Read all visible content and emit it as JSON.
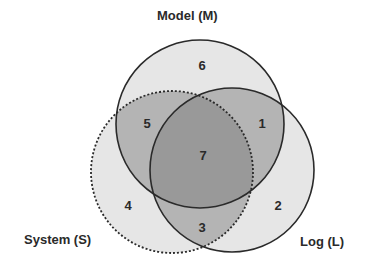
{
  "diagram": {
    "type": "venn",
    "sets": [
      {
        "id": "M",
        "label": "Model (M)",
        "border": "solid"
      },
      {
        "id": "S",
        "label": "System (S)",
        "border": "dotted"
      },
      {
        "id": "L",
        "label": "Log (L)",
        "border": "solid"
      }
    ],
    "regions": {
      "m_only": "6",
      "m_l": "1",
      "l_only": "2",
      "s_l": "3",
      "s_only": "4",
      "m_s": "5",
      "m_s_l": "7"
    },
    "colors": {
      "single": "#e6e6e6",
      "double": "#b4b4b4",
      "triple": "#9a9a9a",
      "stroke": "#2a2a2a"
    }
  }
}
